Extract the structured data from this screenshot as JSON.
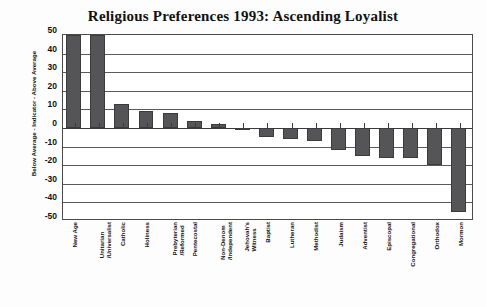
{
  "chart_data": {
    "type": "bar",
    "title": "Religious Preferences 1993: Ascending Loyalist",
    "xlabel": "",
    "ylabel": "Below Average - Indicator - Above Average",
    "ylim": [
      -50,
      50
    ],
    "ytick_labels": [
      "50",
      "40",
      "30",
      "20",
      "10",
      "0",
      "-10",
      "-20",
      "-30",
      "-40",
      "-50"
    ],
    "ytick_values": [
      50,
      40,
      30,
      20,
      10,
      0,
      -10,
      -20,
      -30,
      -40,
      -50
    ],
    "grid": true,
    "legend": "none",
    "orientation": "vertical",
    "bar_color": "#555456",
    "categories": [
      "New Age",
      "Unitarian /Universalist",
      "Catholic",
      "Holiness",
      "Prebyterian /Reformed",
      "Pentecostal",
      "Non-Denom /Independent",
      "Jehovah's Witness",
      "Baptist",
      "Lutheran",
      "Methodist",
      "Judaism",
      "Adventist",
      "Episcopal",
      "Congregational",
      "Orthodox",
      "Mormon"
    ],
    "category_lines": [
      [
        "New Age"
      ],
      [
        "Unitarian",
        "/Universalist"
      ],
      [
        "Catholic"
      ],
      [
        "Holiness"
      ],
      [
        "Prebyterian",
        "/Reformed"
      ],
      [
        "Pentecostal"
      ],
      [
        "Non-Denom",
        "/Independent"
      ],
      [
        "Jehovah's",
        "Witness"
      ],
      [
        "Baptist"
      ],
      [
        "Lutheran"
      ],
      [
        "Methodist"
      ],
      [
        "Judaism"
      ],
      [
        "Adventist"
      ],
      [
        "Episcopal"
      ],
      [
        "Congregational"
      ],
      [
        "Orthodox"
      ],
      [
        "Mormon"
      ]
    ],
    "values": [
      50,
      50,
      13,
      9,
      8,
      4,
      2,
      0,
      -5,
      -6,
      -7,
      -12,
      -15,
      -16,
      -16,
      -20,
      -45
    ]
  },
  "accent_colors": {
    "bar": "#555456",
    "bar_edge": "#3b3b3b",
    "frame": "#4a4a4a",
    "grid": "#5a5a5a",
    "text": "#111111",
    "background": "#fdfdfd"
  }
}
